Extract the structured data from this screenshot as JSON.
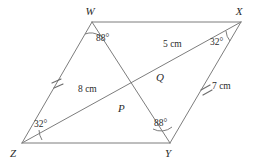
{
  "figure": {
    "background_color": "#ffffff",
    "line_color": "#7d7d7d",
    "text_color": "#2b2b2b"
  },
  "vertices": [
    {
      "name": "W",
      "label": "W",
      "x": 92,
      "y": 22
    },
    {
      "name": "X",
      "label": "X",
      "x": 241,
      "y": 22
    },
    {
      "name": "Y",
      "label": "Y",
      "x": 170,
      "y": 143
    },
    {
      "name": "Z",
      "label": "Z",
      "x": 22,
      "y": 143
    }
  ],
  "interior_points": [
    {
      "name": "Q",
      "label": "Q",
      "x": 152,
      "y": 72
    },
    {
      "name": "P",
      "label": "P",
      "x": 120,
      "y": 101
    }
  ],
  "vertex_label_positions": {
    "W": {
      "x": 90,
      "y": 15
    },
    "X": {
      "x": 239,
      "y": 15
    },
    "Y": {
      "x": 168,
      "y": 157
    },
    "Z": {
      "x": 13,
      "y": 157
    },
    "Q": {
      "x": 156,
      "y": 81
    },
    "P": {
      "x": 118,
      "y": 112
    }
  },
  "angles": [
    {
      "name": "angle-at-W",
      "value": "88°",
      "vertex": "W",
      "label_x": 96,
      "label_y": 41
    },
    {
      "name": "angle-at-X",
      "value": "32°",
      "vertex": "X",
      "label_x": 210,
      "label_y": 45
    },
    {
      "name": "angle-at-Y",
      "value": "88°",
      "vertex": "Y",
      "label_x": 154,
      "label_y": 126
    },
    {
      "name": "angle-at-Z",
      "value": "32°",
      "vertex": "Z",
      "label_x": 34,
      "label_y": 127
    }
  ],
  "length_labels": [
    {
      "name": "length-QX",
      "value": "5 cm",
      "x": 163,
      "y": 47
    },
    {
      "name": "length-ZQ",
      "value": "8 cm",
      "x": 78,
      "y": 92
    },
    {
      "name": "length-XY",
      "value": "7 cm",
      "x": 212,
      "y": 89
    }
  ],
  "congruence_ticks": [
    {
      "name": "tick-WZ",
      "segment": "WZ",
      "x": 57,
      "y": 82
    },
    {
      "name": "tick-XY",
      "segment": "XY",
      "x": 206,
      "y": 86
    }
  ]
}
